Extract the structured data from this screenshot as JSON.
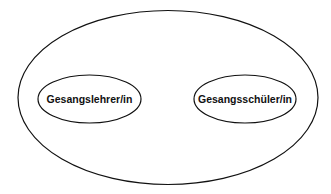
{
  "diagram": {
    "type": "nested-ellipses",
    "outer": {
      "label": ""
    },
    "nodes": [
      {
        "id": "teacher",
        "label": "Gesangslehrer/in"
      },
      {
        "id": "student",
        "label": "Gesangsschüler/in"
      }
    ],
    "colors": {
      "stroke": "#111111",
      "background": "#ffffff"
    }
  }
}
